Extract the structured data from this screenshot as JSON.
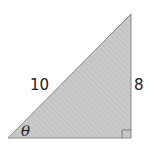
{
  "diagram": {
    "type": "right-triangle",
    "fill_color": "#c9c9c9",
    "hatch_color": "#b4b4b4",
    "stroke_color": "#8a8a8a",
    "vertices": {
      "bottom_left": [
        8,
        138
      ],
      "bottom_right": [
        131,
        138
      ],
      "top": [
        131,
        14
      ]
    },
    "labels": {
      "hypotenuse": "10",
      "opposite": "8",
      "angle": "θ"
    },
    "right_angle_marker": true
  }
}
